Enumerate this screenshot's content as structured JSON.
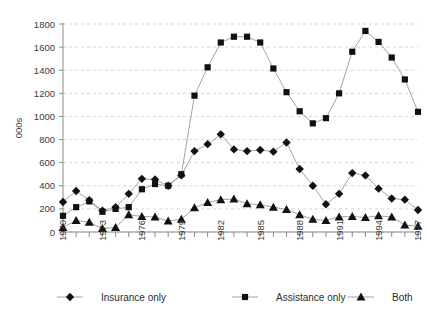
{
  "chart_data": {
    "type": "line",
    "title": "",
    "xlabel": "",
    "ylabel": "000s",
    "ylim": [
      0,
      1800
    ],
    "ytick_step": 200,
    "yticks": [
      0,
      200,
      400,
      600,
      800,
      1000,
      1200,
      1400,
      1600,
      1800
    ],
    "grid": true,
    "legend_position": "bottom",
    "x": [
      1970,
      1971,
      1972,
      1973,
      1974,
      1975,
      1976,
      1977,
      1978,
      1979,
      1980,
      1981,
      1982,
      1983,
      1984,
      1985,
      1986,
      1987,
      1988,
      1989,
      1990,
      1991,
      1992,
      1993,
      1994,
      1995,
      1996,
      1997
    ],
    "xtick_labels": [
      "1970",
      "1973",
      "1976",
      "1979",
      "1982",
      "1985",
      "1988",
      "1991",
      "1994",
      "1997"
    ],
    "xtick_label_years": [
      1970,
      1973,
      1976,
      1979,
      1982,
      1985,
      1988,
      1991,
      1994,
      1997
    ],
    "series": [
      {
        "name": "Insurance only",
        "marker": "diamond",
        "values": [
          260,
          355,
          275,
          185,
          215,
          330,
          460,
          455,
          400,
          490,
          700,
          760,
          845,
          715,
          700,
          710,
          695,
          775,
          545,
          400,
          240,
          330,
          510,
          490,
          375,
          290,
          280,
          190
        ]
      },
      {
        "name": "Assistance only",
        "marker": "square",
        "values": [
          140,
          215,
          265,
          175,
          200,
          215,
          370,
          415,
          400,
          500,
          1180,
          1425,
          1640,
          1690,
          1690,
          1640,
          1415,
          1210,
          1045,
          940,
          985,
          1200,
          1560,
          1740,
          1645,
          1510,
          1320,
          1040
        ]
      },
      {
        "name": "Both",
        "marker": "triangle",
        "values": [
          40,
          100,
          85,
          30,
          40,
          150,
          135,
          130,
          95,
          110,
          210,
          255,
          280,
          285,
          245,
          235,
          215,
          195,
          150,
          110,
          100,
          130,
          135,
          125,
          140,
          130,
          60,
          50
        ]
      }
    ],
    "legend": [
      {
        "label": "Insurance only",
        "marker": "diamond"
      },
      {
        "label": "Assistance only",
        "marker": "square"
      },
      {
        "label": "Both",
        "marker": "triangle"
      }
    ]
  }
}
